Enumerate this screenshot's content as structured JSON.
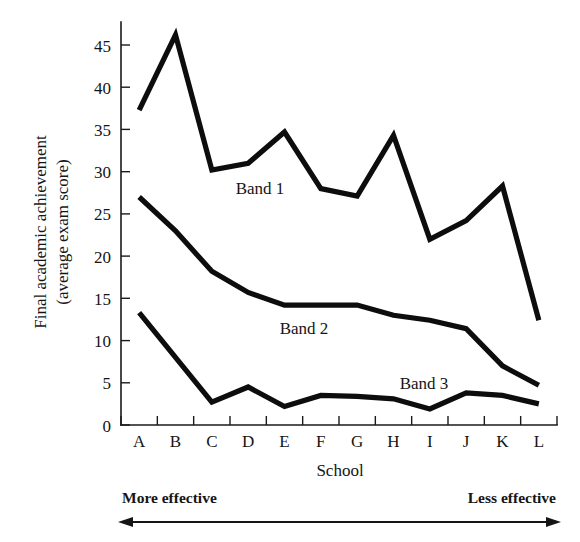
{
  "chart_data": {
    "type": "line",
    "title": "",
    "xlabel": "School",
    "ylabel": "Final academic achievement (average exam score)",
    "ylabel_line1": "Final academic achievement",
    "ylabel_line2": "(average exam score)",
    "categories": [
      "A",
      "B",
      "C",
      "D",
      "E",
      "F",
      "G",
      "H",
      "I",
      "J",
      "K",
      "L"
    ],
    "ylim": [
      0,
      47
    ],
    "yticks": [
      0,
      5,
      10,
      15,
      20,
      25,
      30,
      35,
      40,
      45
    ],
    "ytick_labels": [
      "0",
      "5",
      "10",
      "15",
      "20",
      "25",
      "30",
      "35",
      "40",
      "45"
    ],
    "grid": false,
    "legend_position": "inline-annotations",
    "series": [
      {
        "name": "Band 1",
        "values": [
          37.3,
          46.2,
          30.2,
          31.0,
          34.7,
          28.0,
          27.1,
          34.3,
          22.0,
          24.2,
          28.3,
          12.4
        ]
      },
      {
        "name": "Band 2",
        "values": [
          27.0,
          23.0,
          18.2,
          15.7,
          14.2,
          14.2,
          14.2,
          13.0,
          12.4,
          11.4,
          7.0,
          4.7
        ]
      },
      {
        "name": "Band 3",
        "values": [
          13.3,
          8.0,
          2.7,
          4.5,
          2.2,
          3.5,
          3.4,
          3.1,
          1.9,
          3.8,
          3.5,
          2.5
        ]
      }
    ],
    "annotations": [
      {
        "text": "Band 1",
        "x_category": "D",
        "value": 25.0
      },
      {
        "text": "Band 2",
        "x_category": "E",
        "value": 11.5
      },
      {
        "text": "Band 3",
        "x_category": "H",
        "value": 5.2
      },
      {
        "text": "More effective",
        "position": "below-axis-left"
      },
      {
        "text": "Less effective",
        "position": "below-axis-right"
      }
    ],
    "axis_arrow": {
      "description": "double-headed horizontal arrow spanning the school axis",
      "left_label": "More effective",
      "right_label": "Less effective"
    }
  }
}
